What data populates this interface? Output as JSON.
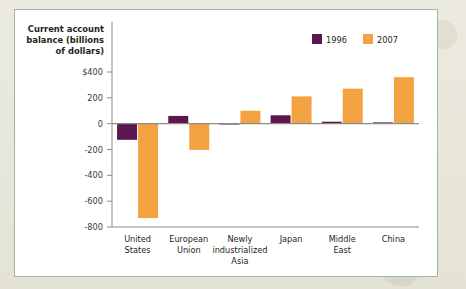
{
  "figure": {
    "panel_border_color": "#9db5a6",
    "panel_background": "#ffffff",
    "page_background": "#e9e7dc"
  },
  "legend": {
    "position": "top-right",
    "entries": [
      {
        "label": "1996",
        "color": "#5e1650",
        "swatch_name": "legend-swatch-1996"
      },
      {
        "label": "2007",
        "color": "#f2a240",
        "swatch_name": "legend-swatch-2007"
      }
    ]
  },
  "axis": {
    "y_title_line1": "Current account",
    "y_title_line2": "balance (billions",
    "y_title_line3": "of dollars)",
    "y_ticks": [
      "$400",
      "200",
      "0",
      "-200",
      "-400",
      "-600",
      "-800"
    ]
  },
  "categories_wrapped": [
    [
      "United",
      "States"
    ],
    [
      "European",
      "Union"
    ],
    [
      "Newly",
      "industrialized",
      "Asia"
    ],
    [
      "Japan"
    ],
    [
      "Middle",
      "East"
    ],
    [
      "China"
    ]
  ],
  "chart_data": {
    "type": "bar",
    "title": "",
    "xlabel": "",
    "ylabel": "Current account balance (billions of dollars)",
    "categories": [
      "United States",
      "European Union",
      "Newly industrialized Asia",
      "Japan",
      "Middle East",
      "China"
    ],
    "series": [
      {
        "name": "1996",
        "color": "#5e1650",
        "values": [
          -125,
          60,
          5,
          65,
          15,
          10
        ]
      },
      {
        "name": "2007",
        "color": "#f2a240",
        "values": [
          -731,
          -203,
          100,
          211,
          271,
          360
        ]
      }
    ],
    "ylim": [
      -800,
      400
    ],
    "yticks": [
      400,
      200,
      0,
      -200,
      -400,
      -600,
      -800
    ],
    "ytick_labels": [
      "$400",
      "200",
      "0",
      "-200",
      "-400",
      "-600",
      "-800"
    ],
    "grid": false,
    "legend_position": "top-right",
    "units": "billions of dollars"
  }
}
